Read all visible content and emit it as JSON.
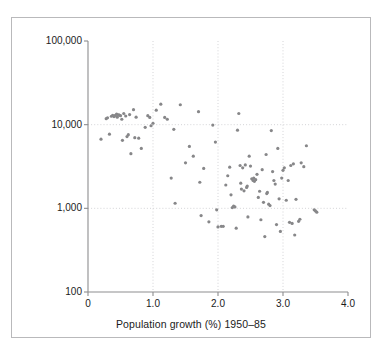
{
  "chart_data": {
    "type": "scatter",
    "title": "",
    "xlabel": "Population growth (%) 1950–85",
    "ylabel": "GDP per capita (log scale) 1989",
    "xlim": [
      0,
      4.0
    ],
    "ylim": [
      100,
      100000
    ],
    "yscale": "log",
    "grid": true,
    "legend": "none",
    "marker": {
      "shape": "circle",
      "color": "#878789",
      "size_px": 3.2
    },
    "xticks": [
      {
        "value": 0,
        "label": "0"
      },
      {
        "value": 1.0,
        "label": "1.0"
      },
      {
        "value": 2.0,
        "label": "2.0"
      },
      {
        "value": 3.0,
        "label": "3.0"
      },
      {
        "value": 4.0,
        "label": "4.0"
      }
    ],
    "yticks": [
      {
        "value": 100,
        "label": "100"
      },
      {
        "value": 1000,
        "label": "1,000"
      },
      {
        "value": 10000,
        "label": "10,000"
      },
      {
        "value": 100000,
        "label": "100,000"
      }
    ],
    "gridlines_x": [
      1.0,
      2.0,
      3.0
    ],
    "gridlines_y": [
      1000,
      10000
    ],
    "n_points": 118,
    "points": [
      [
        0.2,
        6700
      ],
      [
        0.28,
        11800
      ],
      [
        0.3,
        12100
      ],
      [
        0.33,
        7700
      ],
      [
        0.36,
        12600
      ],
      [
        0.4,
        12500
      ],
      [
        0.42,
        12900
      ],
      [
        0.44,
        13400
      ],
      [
        0.45,
        12300
      ],
      [
        0.47,
        13100
      ],
      [
        0.5,
        12800
      ],
      [
        0.52,
        11600
      ],
      [
        0.53,
        6500
      ],
      [
        0.55,
        13600
      ],
      [
        0.58,
        12700
      ],
      [
        0.6,
        7200
      ],
      [
        0.62,
        7600
      ],
      [
        0.64,
        13200
      ],
      [
        0.66,
        4500
      ],
      [
        0.7,
        15100
      ],
      [
        0.72,
        7000
      ],
      [
        0.74,
        12300
      ],
      [
        0.78,
        6900
      ],
      [
        0.82,
        5200
      ],
      [
        0.88,
        9300
      ],
      [
        0.92,
        12800
      ],
      [
        0.95,
        12200
      ],
      [
        0.97,
        9700
      ],
      [
        1.0,
        10400
      ],
      [
        1.05,
        14900
      ],
      [
        1.12,
        17600
      ],
      [
        1.18,
        12200
      ],
      [
        1.22,
        11600
      ],
      [
        1.28,
        2300
      ],
      [
        1.32,
        8800
      ],
      [
        1.34,
        1150
      ],
      [
        1.42,
        17300
      ],
      [
        1.5,
        3500
      ],
      [
        1.56,
        5500
      ],
      [
        1.62,
        4200
      ],
      [
        1.7,
        14300
      ],
      [
        1.72,
        2050
      ],
      [
        1.74,
        820
      ],
      [
        1.78,
        3000
      ],
      [
        1.86,
        690
      ],
      [
        1.92,
        9900
      ],
      [
        1.96,
        6200
      ],
      [
        1.98,
        960
      ],
      [
        2.0,
        600
      ],
      [
        2.05,
        610
      ],
      [
        2.08,
        610
      ],
      [
        2.12,
        1900
      ],
      [
        2.15,
        2450
      ],
      [
        2.18,
        3100
      ],
      [
        2.2,
        1450
      ],
      [
        2.22,
        1020
      ],
      [
        2.24,
        1060
      ],
      [
        2.26,
        1040
      ],
      [
        2.28,
        580
      ],
      [
        2.3,
        8600
      ],
      [
        2.32,
        13600
      ],
      [
        2.34,
        3250
      ],
      [
        2.36,
        1700
      ],
      [
        2.38,
        3050
      ],
      [
        2.4,
        1620
      ],
      [
        2.42,
        3300
      ],
      [
        2.44,
        1780
      ],
      [
        2.46,
        790
      ],
      [
        2.48,
        4200
      ],
      [
        2.5,
        3200
      ],
      [
        2.52,
        2250
      ],
      [
        2.54,
        2150
      ],
      [
        2.56,
        2100
      ],
      [
        2.58,
        2200
      ],
      [
        2.6,
        2550
      ],
      [
        2.62,
        1350
      ],
      [
        2.64,
        1600
      ],
      [
        2.66,
        730
      ],
      [
        2.68,
        2900
      ],
      [
        2.7,
        1180
      ],
      [
        2.72,
        460
      ],
      [
        2.74,
        4400
      ],
      [
        2.76,
        1550
      ],
      [
        2.78,
        1120
      ],
      [
        2.8,
        1080
      ],
      [
        2.82,
        8500
      ],
      [
        2.84,
        2750
      ],
      [
        2.86,
        2150
      ],
      [
        2.88,
        1950
      ],
      [
        2.9,
        640
      ],
      [
        2.92,
        5200
      ],
      [
        2.94,
        1300
      ],
      [
        2.96,
        530
      ],
      [
        2.98,
        2300
      ],
      [
        3.0,
        2850
      ],
      [
        3.02,
        3050
      ],
      [
        3.05,
        1250
      ],
      [
        3.08,
        2150
      ],
      [
        3.1,
        680
      ],
      [
        3.12,
        3250
      ],
      [
        3.14,
        660
      ],
      [
        3.16,
        3400
      ],
      [
        3.18,
        480
      ],
      [
        3.2,
        1280
      ],
      [
        3.24,
        700
      ],
      [
        3.26,
        740
      ],
      [
        3.28,
        3500
      ],
      [
        3.32,
        3150
      ],
      [
        3.36,
        5600
      ],
      [
        3.48,
        960
      ],
      [
        3.5,
        930
      ],
      [
        3.52,
        900
      ],
      [
        0.38,
        12950
      ],
      [
        0.48,
        13000
      ],
      [
        2.35,
        2000
      ],
      [
        2.55,
        2300
      ],
      [
        2.75,
        1500
      ],
      [
        2.45,
        1850
      ]
    ]
  }
}
